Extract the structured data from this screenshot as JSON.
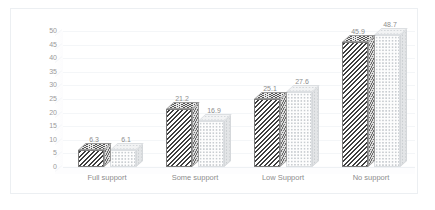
{
  "chart_data": {
    "type": "bar",
    "title": "",
    "subtitle": "",
    "xlabel": "",
    "ylabel": "",
    "categories": [
      "Full support",
      "Some support",
      "Low Support",
      "No support"
    ],
    "series": [
      {
        "name": "Series 1",
        "values": [
          6.3,
          21.2,
          25.1,
          45.9
        ]
      },
      {
        "name": "Series 2",
        "values": [
          6.1,
          16.9,
          27.6,
          48.7
        ]
      }
    ],
    "yticks": [
      0,
      5,
      10,
      15,
      20,
      25,
      30,
      35,
      40,
      45,
      50
    ],
    "ylim": [
      0,
      50
    ],
    "grid": true,
    "legend": "none",
    "three_d": true,
    "colors": {
      "series1": "#3f3f3f",
      "series2": "#e3e5e7",
      "gridline": "#f4f6f8",
      "text": "#8d8d8d",
      "border": "#eceff2"
    }
  }
}
